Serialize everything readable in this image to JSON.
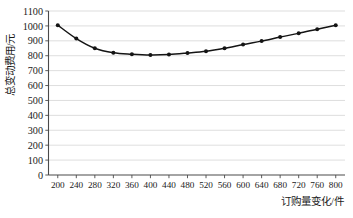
{
  "chart_data": {
    "type": "line",
    "title": "",
    "subtitle": "",
    "xlabel": "订购量变化/件",
    "ylabel": "总变动费用/元",
    "xlim": [
      180,
      820
    ],
    "ylim": [
      0,
      1100
    ],
    "xticks": [
      200,
      240,
      280,
      320,
      360,
      400,
      440,
      480,
      520,
      560,
      600,
      640,
      680,
      720,
      760,
      800
    ],
    "yticks": [
      0,
      100,
      200,
      300,
      400,
      500,
      600,
      700,
      800,
      900,
      1000,
      1100
    ],
    "xtick_labels": [
      "200",
      "240",
      "280",
      "320",
      "360",
      "400",
      "440",
      "480",
      "520",
      "560",
      "600",
      "640",
      "680",
      "720",
      "760",
      "800"
    ],
    "ytick_labels": [
      "0",
      "100",
      "200",
      "300",
      "400",
      "500",
      "600",
      "700",
      "800",
      "900",
      "1000",
      "1100"
    ],
    "grid": "horizontal",
    "legend": "none",
    "marker": "filled-circle",
    "line_color": "#141414",
    "marker_color": "#141414",
    "grid_color": "#c8c8c8",
    "axis_color": "#4a4a4a",
    "x": [
      200,
      240,
      280,
      320,
      360,
      400,
      440,
      480,
      520,
      560,
      600,
      640,
      680,
      720,
      760,
      800
    ],
    "values": [
      1005,
      915,
      850,
      820,
      810,
      805,
      808,
      818,
      830,
      850,
      875,
      898,
      925,
      950,
      978,
      1005
    ],
    "series": [
      {
        "name": "总变动费用",
        "values": [
          1005,
          915,
          850,
          820,
          810,
          805,
          808,
          818,
          830,
          850,
          875,
          898,
          925,
          950,
          978,
          1005
        ]
      }
    ],
    "annotations": []
  }
}
